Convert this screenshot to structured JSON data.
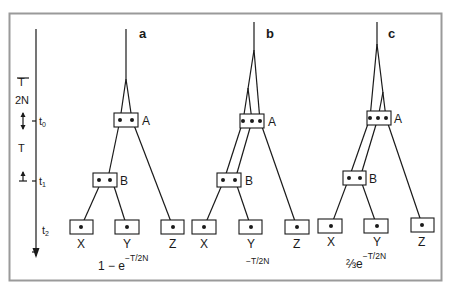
{
  "figure": {
    "panels": [
      {
        "id": "a",
        "label": "a",
        "formula": {
          "prefix": "1 − e",
          "exponent": "−T/2N"
        },
        "nodes": {
          "A": "A",
          "B": "B"
        },
        "leaves": [
          "X",
          "Y",
          "Z"
        ]
      },
      {
        "id": "b",
        "label": "b",
        "formula": {
          "prefix": "",
          "exponent": "−T/2N"
        },
        "nodes": {
          "A": "A",
          "B": "B"
        },
        "leaves": [
          "X",
          "Y",
          "Z"
        ]
      },
      {
        "id": "c",
        "label": "c",
        "formula": {
          "prefix": "⅔e",
          "exponent": "−T/2N"
        },
        "nodes": {
          "A": "A",
          "B": "B"
        },
        "leaves": [
          "X",
          "Y",
          "Z"
        ]
      }
    ],
    "time_axis": {
      "interval_upper": {
        "numerator": "T",
        "denominator": "2N"
      },
      "interval_lower": "T",
      "ticks": [
        {
          "base": "t",
          "sub": "0"
        },
        {
          "base": "t",
          "sub": "1"
        },
        {
          "base": "t",
          "sub": "2"
        }
      ]
    },
    "colors": {
      "ink": "#1a1a1a",
      "frame": "#9a9a9a",
      "background": "#ffffff"
    }
  }
}
